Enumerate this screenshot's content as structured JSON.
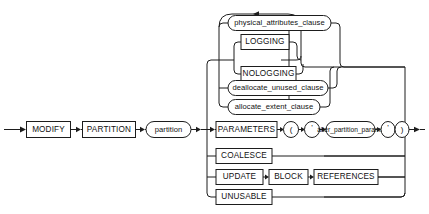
{
  "diagram": {
    "type": "railroad-syntax-diagram",
    "colors": {
      "background": "#ffffff",
      "line": "#1d1d1d",
      "text": "#111111",
      "node_fill": "#ffffff"
    },
    "entry_arrow": "arrow-right",
    "exit_arrow": "arrow-right",
    "loop_arrow": "arrow-left",
    "sequence": [
      {
        "id": "modify",
        "label": "MODIFY",
        "shape": "rect"
      },
      {
        "id": "partition_kw",
        "label": "PARTITION",
        "shape": "rect"
      },
      {
        "id": "partition_nt",
        "label": "partition",
        "shape": "pill"
      }
    ],
    "alternatives": [
      {
        "id": "repeat-group",
        "kind": "loop-group",
        "loop": true,
        "rows": [
          {
            "id": "physical_attributes_clause",
            "label": "physical_attributes_clause",
            "shape": "pill"
          },
          {
            "id": "logging-choice",
            "kind": "nested-choice",
            "options": [
              {
                "id": "logging",
                "label": "LOGGING",
                "shape": "rect"
              },
              {
                "id": "nologging",
                "label": "NOLOGGING",
                "shape": "rect"
              }
            ]
          },
          {
            "id": "deallocate_unused_clause",
            "label": "deallocate_unused_clause",
            "shape": "pill"
          },
          {
            "id": "allocate_extent_clause",
            "label": "allocate_extent_clause",
            "shape": "pill"
          }
        ]
      },
      {
        "id": "parameters-row",
        "kind": "sequence",
        "items": [
          {
            "id": "parameters",
            "label": "PARAMETERS",
            "shape": "rect"
          },
          {
            "id": "lparen",
            "label": "(",
            "shape": "circle"
          },
          {
            "id": "quote-open",
            "label": "'",
            "shape": "circle"
          },
          {
            "id": "alter_partition_params",
            "label": "alter_partition_params",
            "shape": "pill"
          },
          {
            "id": "quote-close",
            "label": "'",
            "shape": "circle"
          },
          {
            "id": "rparen",
            "label": ")",
            "shape": "circle"
          }
        ]
      },
      {
        "id": "coalesce-row",
        "kind": "sequence",
        "items": [
          {
            "id": "coalesce",
            "label": "COALESCE",
            "shape": "rect"
          }
        ]
      },
      {
        "id": "update-row",
        "kind": "sequence",
        "items": [
          {
            "id": "update",
            "label": "UPDATE",
            "shape": "rect"
          },
          {
            "id": "block",
            "label": "BLOCK",
            "shape": "rect"
          },
          {
            "id": "references",
            "label": "REFERENCES",
            "shape": "rect"
          }
        ]
      },
      {
        "id": "unusable-row",
        "kind": "sequence",
        "items": [
          {
            "id": "unusable",
            "label": "UNUSABLE",
            "shape": "rect"
          }
        ]
      }
    ]
  }
}
